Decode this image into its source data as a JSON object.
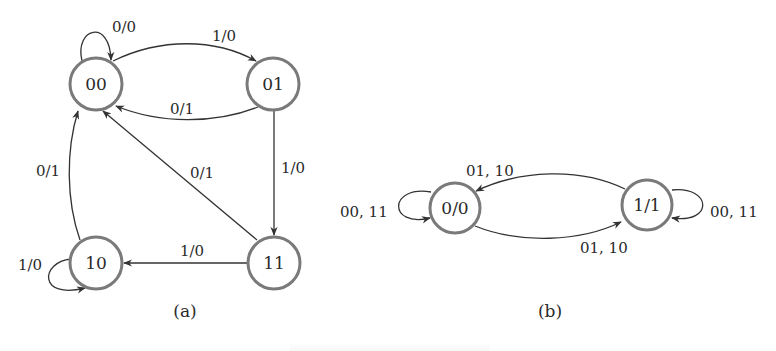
{
  "figure": {
    "panels": [
      {
        "id": "a",
        "caption": "(a)",
        "states": [
          {
            "id": "00",
            "label": "00",
            "cx": 96,
            "cy": 84
          },
          {
            "id": "01",
            "label": "01",
            "cx": 273,
            "cy": 84
          },
          {
            "id": "10",
            "label": "10",
            "cx": 96,
            "cy": 263
          },
          {
            "id": "11",
            "label": "11",
            "cx": 274,
            "cy": 263
          }
        ],
        "transitions": [
          {
            "from": "00",
            "to": "00",
            "label": "0/0"
          },
          {
            "from": "00",
            "to": "01",
            "label": "1/0"
          },
          {
            "from": "01",
            "to": "00",
            "label": "0/1"
          },
          {
            "from": "01",
            "to": "11",
            "label": "1/0"
          },
          {
            "from": "11",
            "to": "00",
            "label": "0/1"
          },
          {
            "from": "11",
            "to": "10",
            "label": "1/0"
          },
          {
            "from": "10",
            "to": "00",
            "label": "0/1"
          },
          {
            "from": "10",
            "to": "10",
            "label": "1/0"
          }
        ]
      },
      {
        "id": "b",
        "caption": "(b)",
        "states": [
          {
            "id": "0/0",
            "label": "0/0",
            "cx": 455,
            "cy": 208
          },
          {
            "id": "1/1",
            "label": "1/1",
            "cx": 647,
            "cy": 205
          }
        ],
        "transitions": [
          {
            "from": "0/0",
            "to": "0/0",
            "label": "00, 11"
          },
          {
            "from": "1/1",
            "to": "0/0",
            "label": "01, 10"
          },
          {
            "from": "0/0",
            "to": "1/1",
            "label": "01, 10"
          },
          {
            "from": "1/1",
            "to": "1/1",
            "label": "00, 11"
          }
        ]
      }
    ]
  },
  "colors": {
    "node_stroke": "#7a7a7a",
    "edge_stroke": "#333333",
    "text": "#2a2a2a",
    "background": "#ffffff"
  }
}
